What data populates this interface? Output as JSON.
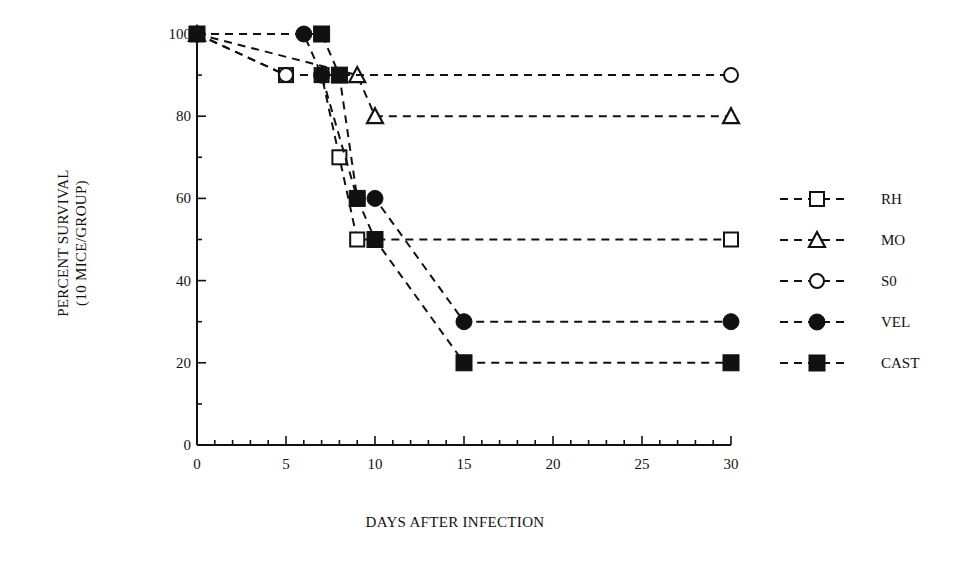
{
  "chart_data": {
    "type": "line",
    "title": "",
    "xlabel": "DAYS AFTER INFECTION",
    "ylabel": "PERCENT SURVIVAL",
    "ylabel_sub": "(10 MICE/GROUP)",
    "xlim": [
      0,
      30
    ],
    "ylim": [
      0,
      100
    ],
    "x_ticks": [
      0,
      5,
      10,
      15,
      20,
      25,
      30
    ],
    "y_ticks": [
      0,
      20,
      40,
      60,
      80,
      100
    ],
    "x_minor_step": 1,
    "y_minor_step": 10,
    "grid": false,
    "legend_position": "right",
    "line_style": "dashed",
    "series": [
      {
        "name": "RH",
        "marker": "square-open",
        "x": [
          0,
          5,
          7,
          8,
          9,
          30
        ],
        "y": [
          100,
          90,
          90,
          70,
          50,
          50
        ]
      },
      {
        "name": "MO",
        "marker": "triangle-open",
        "x": [
          0,
          9,
          10,
          30
        ],
        "y": [
          100,
          90,
          80,
          80
        ]
      },
      {
        "name": "S0",
        "marker": "circle-open",
        "x": [
          0,
          5,
          30
        ],
        "y": [
          100,
          90,
          90
        ]
      },
      {
        "name": "VEL",
        "marker": "circle-filled",
        "x": [
          0,
          6,
          7,
          9,
          10,
          15,
          30
        ],
        "y": [
          100,
          100,
          90,
          60,
          60,
          30,
          30
        ]
      },
      {
        "name": "CAST",
        "marker": "square-filled",
        "x": [
          0,
          7,
          8,
          9,
          10,
          15,
          30
        ],
        "y": [
          100,
          100,
          90,
          60,
          50,
          20,
          20
        ]
      }
    ]
  },
  "labels": {
    "xlabel": "DAYS AFTER INFECTION",
    "ylabel": "PERCENT SURVIVAL",
    "ylabel_sub": "(10 MICE/GROUP)"
  },
  "colors": {
    "ink": "#111111",
    "background": "#ffffff"
  }
}
